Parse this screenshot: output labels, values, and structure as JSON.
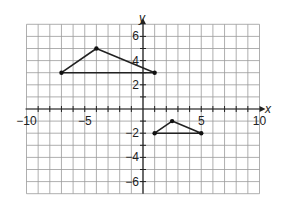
{
  "chart_data": {
    "type": "scatter",
    "title": "",
    "xlabel": "x",
    "ylabel": "y",
    "xlim": [
      -10,
      10
    ],
    "ylim": [
      -7,
      7
    ],
    "grid": true,
    "x_tick_labels": [
      "-10",
      "-5",
      "5",
      "10"
    ],
    "y_tick_labels": [
      "6",
      "4",
      "2",
      "-2",
      "-4",
      "-6"
    ],
    "shapes": [
      {
        "name": "large triangle",
        "vertices": [
          [
            -7,
            3
          ],
          [
            -4,
            5
          ],
          [
            1,
            3
          ]
        ]
      },
      {
        "name": "small triangle",
        "vertices": [
          [
            1,
            -2
          ],
          [
            2.5,
            -1
          ],
          [
            5,
            -2
          ]
        ]
      }
    ]
  },
  "labels": {
    "x_axis": "x",
    "y_axis": "y",
    "xticks": [
      {
        "v": -10,
        "t": "−10"
      },
      {
        "v": -5,
        "t": "−5"
      },
      {
        "v": 5,
        "t": "5"
      },
      {
        "v": 10,
        "t": "10"
      }
    ],
    "yticks": [
      {
        "v": 6,
        "t": "6"
      },
      {
        "v": 4,
        "t": "4"
      },
      {
        "v": 2,
        "t": "2"
      },
      {
        "v": -2,
        "t": "−2"
      },
      {
        "v": -4,
        "t": "−4"
      },
      {
        "v": -6,
        "t": "−6"
      }
    ]
  }
}
